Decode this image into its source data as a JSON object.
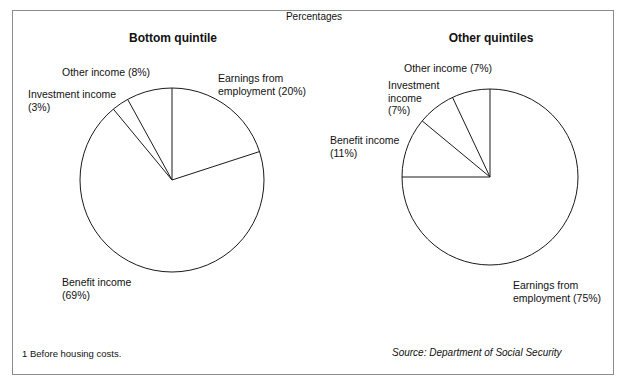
{
  "figure": {
    "units_label": "Percentages",
    "footnote": "1  Before housing costs.",
    "source": "Source: Department of Social Security",
    "border_color": "#8c8c8c",
    "line_color": "#1a1a1a"
  },
  "chart_data": [
    {
      "type": "pie",
      "title": "Bottom quintile",
      "categories": [
        "Earnings from employment",
        "Benefit income",
        "Investment income",
        "Other income"
      ],
      "values": [
        20,
        69,
        3,
        8
      ],
      "labels": [
        "Earnings from\nemployment (20%)",
        "Benefit income\n(69%)",
        "Investment income\n(3%)",
        "Other income (8%)"
      ],
      "start_angle": 0,
      "direction": "clockwise",
      "center": [
        172,
        180
      ],
      "radius": 92,
      "label_positions": [
        {
          "left": 218,
          "top": 72,
          "align": "left"
        },
        {
          "left": 62,
          "top": 276,
          "align": "left"
        },
        {
          "left": 28,
          "top": 88,
          "align": "left"
        },
        {
          "left": 62,
          "top": 66,
          "align": "left"
        }
      ]
    },
    {
      "type": "pie",
      "title": "Other quintiles",
      "categories": [
        "Earnings from employment",
        "Benefit income",
        "Investment income",
        "Other income"
      ],
      "values": [
        75,
        11,
        7,
        7
      ],
      "labels": [
        "Earnings from\nemployment (75%)",
        "Benefit income\n(11%)",
        "Investment\nincome\n(7%)",
        "Other income (7%)"
      ],
      "start_angle": 0,
      "direction": "clockwise",
      "center": [
        490,
        177
      ],
      "radius": 88,
      "label_positions": [
        {
          "left": 513,
          "top": 279,
          "align": "left"
        },
        {
          "left": 330,
          "top": 134,
          "align": "left"
        },
        {
          "left": 388,
          "top": 79,
          "align": "left"
        },
        {
          "left": 404,
          "top": 62,
          "align": "left"
        }
      ]
    }
  ]
}
